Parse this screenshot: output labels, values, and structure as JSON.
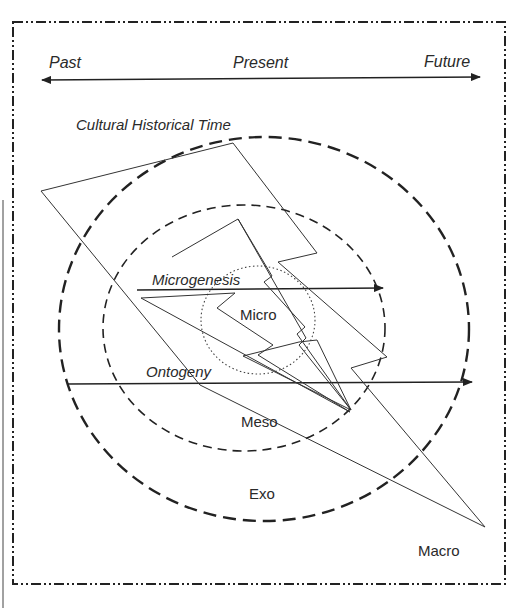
{
  "timeline": {
    "past": "Past",
    "present": "Present",
    "future": "Future"
  },
  "circles": {
    "cultural_historical_time": "Cultural Historical Time",
    "micro": "Micro",
    "meso": "Meso",
    "exo": "Exo",
    "macro": "Macro"
  },
  "arrows": {
    "microgenesis": "Microgenesis",
    "ontogeny": "Ontogeny"
  },
  "colors": {
    "stroke": "#222222",
    "background": "#ffffff"
  }
}
